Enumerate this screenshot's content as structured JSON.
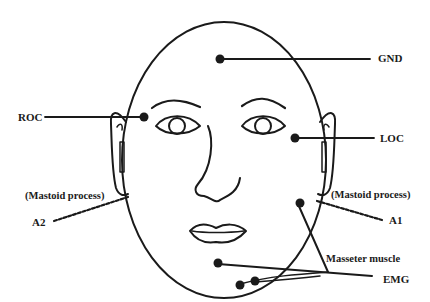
{
  "diagram": {
    "type": "electrode-placement-face",
    "stroke_color": "#1a1a1a",
    "background": "#ffffff",
    "labels": {
      "gnd": "GND",
      "roc": "ROC",
      "loc": "LOC",
      "a1": "A1",
      "a2": "A2",
      "mastoid_left": "(Mastoid process)",
      "mastoid_right": "(Mastoid process)",
      "masseter": "Masseter muscle",
      "emg": "EMG"
    },
    "electrodes": [
      {
        "id": "gnd",
        "label": "GND"
      },
      {
        "id": "roc",
        "label": "ROC"
      },
      {
        "id": "loc",
        "label": "LOC"
      },
      {
        "id": "a1",
        "label": "A1"
      },
      {
        "id": "a2",
        "label": "A2"
      },
      {
        "id": "emg-chin",
        "label": "EMG"
      },
      {
        "id": "emg-jaw-1",
        "label": "EMG"
      },
      {
        "id": "emg-jaw-2",
        "label": "EMG"
      },
      {
        "id": "masseter",
        "label": "Masseter muscle"
      }
    ]
  }
}
